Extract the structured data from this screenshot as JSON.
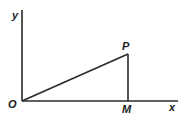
{
  "diagram": {
    "type": "coordinate-geometry",
    "labels": {
      "y_axis": "y",
      "x_axis": "x",
      "origin": "O",
      "point_p": "P",
      "point_m": "M"
    },
    "colors": {
      "stroke": "#2a2a2a",
      "background": "#ffffff"
    },
    "points": {
      "O": [
        22,
        101
      ],
      "P": [
        128,
        54
      ],
      "M": [
        128,
        101
      ]
    },
    "segments": [
      "OP",
      "PM",
      "OM"
    ]
  }
}
